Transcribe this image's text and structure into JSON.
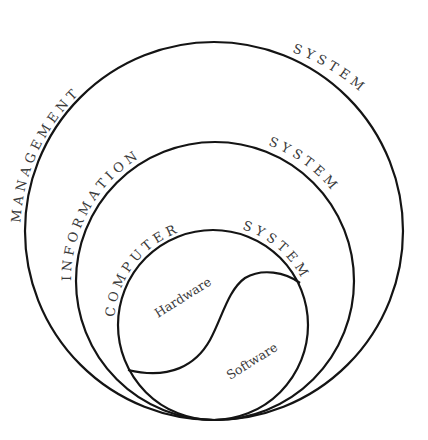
{
  "diagram": {
    "type": "nested-circles",
    "colors": {
      "stroke": "#141414",
      "text": "#3a3a3a",
      "background": "#ffffff"
    },
    "circles": [
      {
        "id": "management",
        "label_left": "M A N A G E M E N T",
        "label_right": "S Y S T E M",
        "cx": 214,
        "cy": 231,
        "r": 190
      },
      {
        "id": "information",
        "label_left": "I N F O R M A T I O N",
        "label_right": "S Y S T E M",
        "cx": 215,
        "cy": 281,
        "r": 140
      },
      {
        "id": "computer",
        "label_left": "C O M P U T E R",
        "label_right": "S Y S T E M",
        "cx": 213,
        "cy": 325,
        "r": 95
      }
    ],
    "regions": {
      "hardware": "Hardware",
      "software": "Software"
    }
  }
}
